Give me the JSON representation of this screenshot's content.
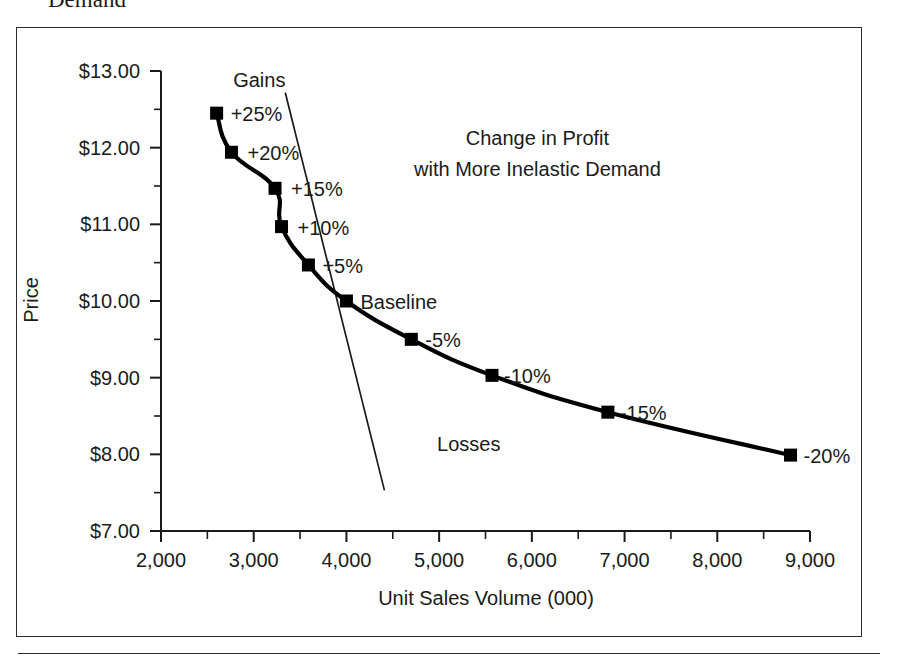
{
  "page": {
    "heading_clipped": "Demand"
  },
  "chart_data": {
    "type": "line",
    "title": "",
    "xlabel": "Unit Sales Volume (000)",
    "ylabel": "Price",
    "xlim": [
      2000,
      9000
    ],
    "ylim": [
      7.0,
      13.0
    ],
    "grid": false,
    "legend": "none",
    "x_ticks": [
      "2,000",
      "3,000",
      "4,000",
      "5,000",
      "6,000",
      "7,000",
      "8,000",
      "9,000"
    ],
    "x_tick_values": [
      2000,
      3000,
      4000,
      5000,
      6000,
      7000,
      8000,
      9000
    ],
    "x_minor_step": 500,
    "y_ticks": [
      "$7.00",
      "$8.00",
      "$9.00",
      "$10.00",
      "$11.00",
      "$12.00",
      "$13.00"
    ],
    "y_tick_values": [
      7,
      8,
      9,
      10,
      11,
      12,
      13
    ],
    "y_minor_step": 0.5,
    "series": [
      {
        "name": "Iso-profit curve",
        "style": "thick-line-with-square-markers",
        "points": [
          {
            "x": 2600,
            "y": 12.45,
            "label": "+25%"
          },
          {
            "x": 2760,
            "y": 11.94,
            "label": "+20%"
          },
          {
            "x": 3230,
            "y": 11.47,
            "label": "+15%"
          },
          {
            "x": 3300,
            "y": 10.97,
            "label": "+10%"
          },
          {
            "x": 3590,
            "y": 10.47,
            "label": "+5%"
          },
          {
            "x": 4000,
            "y": 10.0,
            "label": "Baseline"
          },
          {
            "x": 4700,
            "y": 9.5,
            "label": "-5%"
          },
          {
            "x": 5570,
            "y": 9.03,
            "label": "-10%"
          },
          {
            "x": 6820,
            "y": 8.55,
            "label": "-15%"
          },
          {
            "x": 8790,
            "y": 7.99,
            "label": "-20%"
          }
        ]
      },
      {
        "name": "Demand curve",
        "style": "thin-straight-line",
        "points": [
          {
            "x": 3340,
            "y": 12.72
          },
          {
            "x": 4410,
            "y": 7.53
          }
        ]
      }
    ],
    "annotations": [
      {
        "id": "gains",
        "text": "Gains",
        "x": 3060,
        "y": 12.79
      },
      {
        "id": "losses",
        "text": "Losses",
        "x": 5320,
        "y": 8.05
      },
      {
        "id": "callout-line-1",
        "text": "Change in Profit",
        "x": 6060,
        "y": 12.03
      },
      {
        "id": "callout-line-2",
        "text": "with More Inelastic Demand",
        "x": 6060,
        "y": 11.63
      }
    ]
  },
  "colors": {
    "ink": "#1a1a1a",
    "marker": "#000000",
    "frame": "#2b2b2b",
    "background": "#ffffff"
  }
}
